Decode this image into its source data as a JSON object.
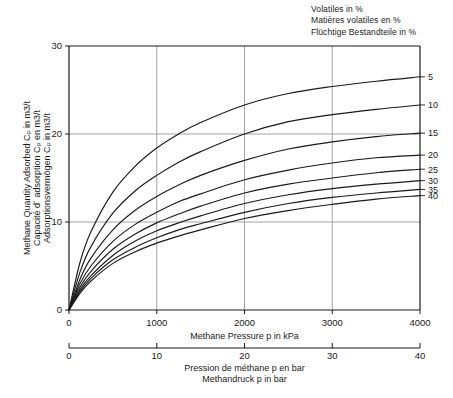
{
  "figure": {
    "legend_title": {
      "line_en": "Volatiles in %",
      "line_fr": "Matières volatiles en %",
      "line_de": "Flüchtige Bestandteile in %"
    },
    "y_axis_title": {
      "line_en": "Methane Quantity Adsorbed Cₚ in m3/t",
      "line_fr": "Capacité d´ adsorption Cₚ en m3/t",
      "line_de": "Adsorptionsvermögen Cₚ in m3/t"
    },
    "x_axis_primary_title": "Methane Pressure p in kPa",
    "x_axis_secondary_title": {
      "line_fr": "Pression de méthane p en bar",
      "line_de": "Methandruck p in bar"
    },
    "colors": {
      "curve": "#1a1a1a",
      "axis": "#1a1a1a",
      "grid": "#9a9a9a",
      "text": "#1a1a1a"
    }
  },
  "chart_data": {
    "type": "line",
    "title": "",
    "xlabel": "Methane Pressure p in kPa",
    "ylabel": "Methane Quantity Adsorbed Cₚ in m3/t",
    "xlim": [
      0,
      4000
    ],
    "ylim": [
      0,
      30
    ],
    "xticks": [
      0,
      1000,
      2000,
      3000,
      4000
    ],
    "xticklabels": [
      "0",
      "1000",
      "2000",
      "3000",
      "4000"
    ],
    "yticks": [
      0,
      10,
      20,
      30
    ],
    "yticklabels": [
      "0",
      "10",
      "20",
      "30"
    ],
    "secondary_xlim": [
      0,
      40
    ],
    "secondary_xticks": [
      0,
      10,
      20,
      30,
      40
    ],
    "secondary_xticklabels": [
      "0",
      "10",
      "20",
      "30",
      "40"
    ],
    "secondary_xlabel": "Pression de méthane p en bar / Methandruck p in bar",
    "grid": true,
    "grid_x": [
      1000,
      2000,
      3000
    ],
    "grid_y": [
      10,
      20
    ],
    "legend": "right-edge curve labels",
    "legend_position": "right",
    "series": [
      {
        "name": "5",
        "label": "5",
        "x": [
          0,
          125,
          250,
          500,
          750,
          1000,
          1250,
          1500,
          2000,
          2500,
          3000,
          3500,
          4000
        ],
        "y": [
          0,
          5.4,
          8.9,
          13.4,
          16.3,
          18.4,
          20.0,
          21.3,
          23.3,
          24.6,
          25.4,
          26.0,
          26.5
        ]
      },
      {
        "name": "10",
        "label": "10",
        "x": [
          0,
          125,
          250,
          500,
          750,
          1000,
          1250,
          1500,
          2000,
          2500,
          3000,
          3500,
          4000
        ],
        "y": [
          0,
          4.3,
          7.2,
          11.0,
          13.5,
          15.3,
          16.8,
          18.0,
          20.0,
          21.4,
          22.2,
          22.8,
          23.3
        ]
      },
      {
        "name": "15",
        "label": "15",
        "x": [
          0,
          125,
          250,
          500,
          750,
          1000,
          1250,
          1500,
          2000,
          2500,
          3000,
          3500,
          4000
        ],
        "y": [
          0,
          3.5,
          5.9,
          9.1,
          11.3,
          12.9,
          14.2,
          15.3,
          17.0,
          18.3,
          19.1,
          19.7,
          20.1
        ]
      },
      {
        "name": "20",
        "label": "20",
        "x": [
          0,
          125,
          250,
          500,
          750,
          1000,
          1250,
          1500,
          2000,
          2500,
          3000,
          3500,
          4000
        ],
        "y": [
          0,
          3.0,
          5.0,
          7.8,
          9.7,
          11.1,
          12.3,
          13.2,
          14.8,
          15.9,
          16.7,
          17.3,
          17.6
        ]
      },
      {
        "name": "25",
        "label": "25",
        "x": [
          0,
          125,
          250,
          500,
          750,
          1000,
          1250,
          1500,
          2000,
          2500,
          3000,
          3500,
          4000
        ],
        "y": [
          0,
          2.6,
          4.4,
          6.9,
          8.6,
          9.9,
          10.9,
          11.8,
          13.3,
          14.3,
          15.0,
          15.6,
          16.0
        ]
      },
      {
        "name": "30",
        "label": "30",
        "x": [
          0,
          125,
          250,
          500,
          750,
          1000,
          1250,
          1500,
          2000,
          2500,
          3000,
          3500,
          4000
        ],
        "y": [
          0,
          2.3,
          3.9,
          6.2,
          7.8,
          9.0,
          9.9,
          10.7,
          12.1,
          13.1,
          13.8,
          14.3,
          14.7
        ]
      },
      {
        "name": "35",
        "label": "35",
        "x": [
          0,
          125,
          250,
          500,
          750,
          1000,
          1250,
          1500,
          2000,
          2500,
          3000,
          3500,
          4000
        ],
        "y": [
          0,
          2.1,
          3.6,
          5.7,
          7.1,
          8.2,
          9.1,
          9.8,
          11.1,
          12.1,
          12.8,
          13.3,
          13.7
        ]
      },
      {
        "name": "40",
        "label": "40",
        "x": [
          0,
          125,
          250,
          500,
          750,
          1000,
          1250,
          1500,
          2000,
          2500,
          3000,
          3500,
          4000
        ],
        "y": [
          0,
          1.9,
          3.3,
          5.3,
          6.6,
          7.6,
          8.4,
          9.1,
          10.4,
          11.3,
          12.0,
          12.6,
          13.0
        ]
      }
    ]
  }
}
